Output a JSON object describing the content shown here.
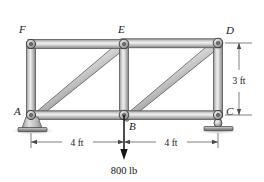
{
  "figure": {
    "type": "truss-free-body-diagram",
    "background_color": "#ffffff",
    "member_fill_light": "#e8e8e8",
    "member_fill_mid": "#b9b9b9",
    "member_fill_dark": "#7d7d7d",
    "outline_color": "#3a3a3a"
  },
  "joints": [
    {
      "id": "F",
      "label": "F",
      "x": 31,
      "y": 44,
      "label_x": 19,
      "label_y": 33,
      "support": "none"
    },
    {
      "id": "E",
      "label": "E",
      "x": 124,
      "y": 44,
      "label_x": 118,
      "label_y": 33,
      "support": "none"
    },
    {
      "id": "D",
      "label": "D",
      "x": 218,
      "y": 43,
      "label_x": 226,
      "label_y": 34,
      "support": "none"
    },
    {
      "id": "A",
      "label": "A",
      "x": 31,
      "y": 115,
      "label_x": 16,
      "label_y": 114,
      "support": "pin"
    },
    {
      "id": "B",
      "label": "B",
      "x": 124,
      "y": 115,
      "label_x": 130,
      "label_y": 128,
      "support": "none"
    },
    {
      "id": "C",
      "label": "C",
      "x": 218,
      "y": 115,
      "label_x": 226,
      "label_y": 114,
      "support": "roller"
    }
  ],
  "members": [
    {
      "id": "FE",
      "from": "F",
      "to": "E",
      "kind": "top-chord"
    },
    {
      "id": "ED",
      "from": "E",
      "to": "D",
      "kind": "top-chord"
    },
    {
      "id": "AB",
      "from": "A",
      "to": "B",
      "kind": "bottom-chord"
    },
    {
      "id": "BC",
      "from": "B",
      "to": "C",
      "kind": "bottom-chord"
    },
    {
      "id": "FA",
      "from": "F",
      "to": "A",
      "kind": "vertical"
    },
    {
      "id": "EB",
      "from": "E",
      "to": "B",
      "kind": "vertical"
    },
    {
      "id": "DC",
      "from": "D",
      "to": "C",
      "kind": "vertical"
    },
    {
      "id": "AE",
      "from": "A",
      "to": "E",
      "kind": "diagonal"
    },
    {
      "id": "BD",
      "from": "B",
      "to": "D",
      "kind": "diagonal"
    }
  ],
  "load": {
    "label": "800 lb",
    "magnitude": 800,
    "unit": "lb",
    "applied_at": "B",
    "direction": "down",
    "tip_x": 124,
    "tip_y": 158,
    "label_x": 124,
    "label_y": 172
  },
  "dimensions": [
    {
      "id": "span-left",
      "label": "4 ft",
      "from": "A",
      "to": "B",
      "orientation": "horizontal",
      "label_x": 77,
      "label_y": 145,
      "line_y": 142,
      "x1": 31,
      "x2": 124
    },
    {
      "id": "span-right",
      "label": "4 ft",
      "from": "B",
      "to": "C",
      "orientation": "horizontal",
      "label_x": 171,
      "label_y": 145,
      "line_y": 142,
      "x1": 124,
      "x2": 218
    },
    {
      "id": "height",
      "label": "3 ft",
      "from": "D",
      "to": "C",
      "orientation": "vertical",
      "label_x": 247,
      "label_y": 83,
      "line_x": 239,
      "y1": 43,
      "y2": 115
    }
  ],
  "supports": {
    "pin": {
      "at": "A",
      "type": "pin-bracket-with-baseplate"
    },
    "roller": {
      "at": "C",
      "type": "roller-with-baseplate"
    }
  }
}
